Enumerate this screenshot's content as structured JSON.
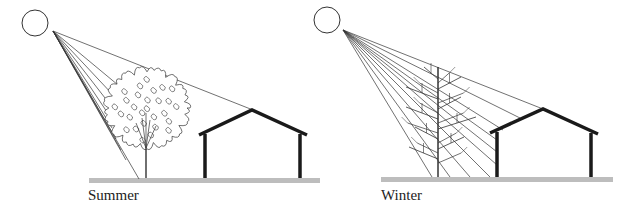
{
  "panels": [
    {
      "id": "summer",
      "label": "Summer",
      "tree_state": "leafy",
      "sun": {
        "cx": 35,
        "cy": 23,
        "r": 13
      },
      "ray_origin": [
        53,
        31
      ],
      "ray_targets": [
        [
          253,
          110
        ],
        [
          118,
          85
        ],
        [
          114,
          96
        ],
        [
          112,
          107
        ],
        [
          111,
          118
        ],
        [
          112,
          128
        ],
        [
          116,
          139
        ],
        [
          121,
          150
        ],
        [
          126,
          160
        ],
        [
          139,
          179
        ]
      ],
      "ground": {
        "x1": 89,
        "x2": 320,
        "y": 178
      },
      "house": {
        "left_wall_x": 205,
        "right_wall_x": 300,
        "peak": [
          252,
          110
        ],
        "eave_left": [
          199,
          135
        ],
        "eave_right": [
          307,
          135
        ],
        "base_y": 178
      },
      "tree": {
        "trunk_x": 146,
        "base_y": 178,
        "crown_cx": 147,
        "crown_cy": 108,
        "crown_rx": 40,
        "crown_ry": 38
      }
    },
    {
      "id": "winter",
      "label": "Winter",
      "tree_state": "bare",
      "sun": {
        "cx": 327,
        "cy": 20,
        "r": 13
      },
      "ray_origin": [
        343,
        30
      ],
      "ray_targets": [
        [
          543,
          109
        ],
        [
          520,
          118
        ],
        [
          503,
          130
        ],
        [
          497,
          140
        ],
        [
          497,
          152
        ],
        [
          497,
          165
        ],
        [
          490,
          177
        ],
        [
          470,
          177
        ],
        [
          450,
          177
        ],
        [
          432,
          177
        ]
      ],
      "ground": {
        "x1": 381,
        "x2": 613,
        "y": 177
      },
      "house": {
        "left_wall_x": 497,
        "right_wall_x": 591,
        "peak": [
          543,
          109
        ],
        "eave_left": [
          490,
          133
        ],
        "eave_right": [
          598,
          134
        ],
        "base_y": 177
      },
      "tree": {
        "trunk_x": 438,
        "base_y": 177,
        "top_y": 67
      }
    }
  ],
  "colors": {
    "line": "#333333",
    "ground": "#bdbdbd",
    "house": "#1a1a1a"
  }
}
